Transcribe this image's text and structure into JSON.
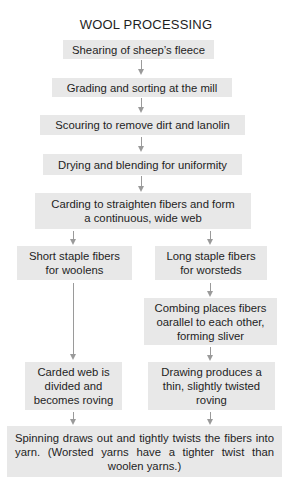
{
  "title": "WOOL PROCESSING",
  "steps": {
    "shearing": "Shearing of sheep’s fleece",
    "grading": "Grading and sorting at the mill",
    "scouring": "Scouring to remove dirt and lanolin",
    "drying": "Drying and blending for uniformity",
    "carding": "Carding to straighten fibers and form a continuous, wide web"
  },
  "branches": {
    "woolen": {
      "staple": "Short staple fibers for woolens",
      "roving": "Carded web is divided and becomes roving"
    },
    "worsted": {
      "staple": "Long staple fibers for worsteds",
      "combing": "Combing places fibers oarallel to each other, forming sliver",
      "drawing": "Drawing produces a thin, slightly twisted roving"
    }
  },
  "final": "Spinning draws out and tightly twists the fibers into yarn. (Worsted yarns have a tighter twist than woolen yarns.)",
  "colors": {
    "box_fill": "#e8e8e8",
    "arrow": "#9a9a9a",
    "text": "#1e1e1e"
  }
}
